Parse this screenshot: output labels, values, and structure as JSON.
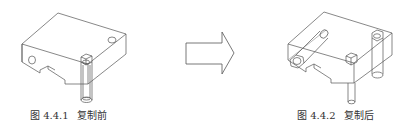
{
  "figures": [
    {
      "id": "4.4.1",
      "caption_number": "图 4.4.1",
      "caption_text": "复制前",
      "description": "Isometric wireframe block with one bolt"
    },
    {
      "id": "4.4.2",
      "caption_number": "图 4.4.2",
      "caption_text": "复制后",
      "description": "Isometric wireframe block with copied bolts"
    }
  ],
  "arrow": {
    "direction": "right",
    "color": "#555555"
  }
}
